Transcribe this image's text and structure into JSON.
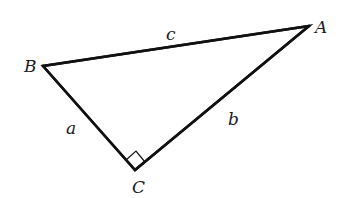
{
  "diagram": {
    "type": "right-triangle",
    "vertices": [
      {
        "id": "A",
        "label": "A",
        "x": 309,
        "y": 26
      },
      {
        "id": "B",
        "label": "B",
        "x": 43,
        "y": 66
      },
      {
        "id": "C",
        "label": "C",
        "x": 135,
        "y": 170
      }
    ],
    "sides": [
      {
        "id": "a",
        "label": "a",
        "from": "B",
        "to": "C"
      },
      {
        "id": "b",
        "label": "b",
        "from": "C",
        "to": "A"
      },
      {
        "id": "c",
        "label": "c",
        "from": "B",
        "to": "A"
      }
    ],
    "right_angle_at": "C",
    "labels": {
      "A": "A",
      "B": "B",
      "C": "C",
      "a": "a",
      "b": "b",
      "c": "c"
    },
    "colors": {
      "line": "#111111",
      "text": "#1a1a1a",
      "background": "#ffffff"
    }
  }
}
